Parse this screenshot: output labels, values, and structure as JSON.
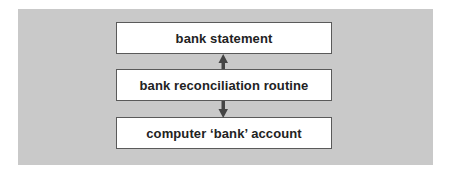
{
  "diagram": {
    "type": "flow",
    "nodes": [
      {
        "id": "bank-statement",
        "label": "bank statement"
      },
      {
        "id": "bank-reconciliation-routine",
        "label": "bank reconciliation routine"
      },
      {
        "id": "computer-bank-account",
        "label": "computer ‘bank’ account"
      }
    ],
    "edges": [
      {
        "from": "bank-reconciliation-routine",
        "to": "bank-statement",
        "direction": "up"
      },
      {
        "from": "bank-reconciliation-routine",
        "to": "computer-bank-account",
        "direction": "down"
      }
    ],
    "colors": {
      "panel": "#c9c9c9",
      "box_fill": "#ffffff",
      "box_border": "#5a5a5a",
      "arrow": "#444444",
      "text": "#222222"
    }
  }
}
